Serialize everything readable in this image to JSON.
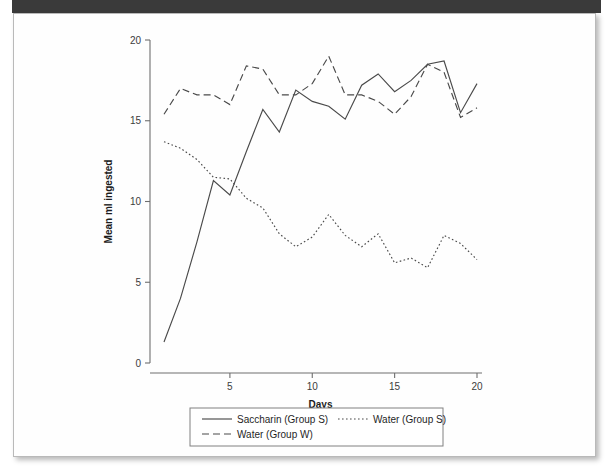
{
  "page": {
    "background_color": "#ffffff",
    "sheet_color": "#fefefe",
    "top_bar_color": "#3a3a3a",
    "border_color": "#b9b9b9"
  },
  "chart_data": {
    "type": "line",
    "title": "",
    "xlabel": "Days",
    "ylabel": "Mean ml ingested",
    "xlim": [
      1,
      20
    ],
    "ylim": [
      0,
      20
    ],
    "x_ticks": [
      5,
      10,
      15,
      20
    ],
    "y_ticks": [
      0,
      5,
      10,
      15,
      20
    ],
    "grid": false,
    "legend_position": "bottom",
    "x": [
      1,
      2,
      3,
      4,
      5,
      6,
      7,
      8,
      9,
      10,
      11,
      12,
      13,
      14,
      15,
      16,
      17,
      18,
      19,
      20
    ],
    "series": [
      {
        "name": "Saccharin (Group S)",
        "style": "solid",
        "color": "#4a4a4a",
        "values": [
          1.3,
          4.0,
          7.5,
          11.3,
          10.4,
          13.1,
          15.7,
          14.3,
          16.9,
          16.2,
          15.9,
          15.1,
          17.2,
          17.9,
          16.8,
          17.5,
          18.5,
          18.7,
          15.5,
          17.3
        ]
      },
      {
        "name": "Water (Group S)",
        "style": "dotted",
        "color": "#4a4a4a",
        "values": [
          13.7,
          13.3,
          12.6,
          11.5,
          11.4,
          10.2,
          9.6,
          8.0,
          7.2,
          7.8,
          9.2,
          7.9,
          7.2,
          8.0,
          6.2,
          6.5,
          5.9,
          7.9,
          7.4,
          6.4
        ]
      },
      {
        "name": "Water (Group W)",
        "style": "dashed",
        "color": "#4a4a4a",
        "values": [
          15.4,
          17.0,
          16.6,
          16.6,
          16.0,
          18.4,
          18.2,
          16.6,
          16.6,
          17.3,
          19.0,
          16.6,
          16.6,
          16.2,
          15.4,
          16.5,
          18.5,
          18.0,
          15.2,
          15.8
        ]
      }
    ]
  },
  "legend": {
    "entries": [
      {
        "label": "Saccharin (Group S)",
        "style": "solid"
      },
      {
        "label": "Water (Group S)",
        "style": "dotted"
      },
      {
        "label": "Water (Group W)",
        "style": "dashed"
      }
    ]
  },
  "axes": {
    "x_tick_labels": [
      "5",
      "10",
      "15",
      "20"
    ],
    "y_tick_labels": [
      "0",
      "5",
      "10",
      "15",
      "20"
    ],
    "x_title": "Days",
    "y_title": "Mean ml ingested"
  }
}
